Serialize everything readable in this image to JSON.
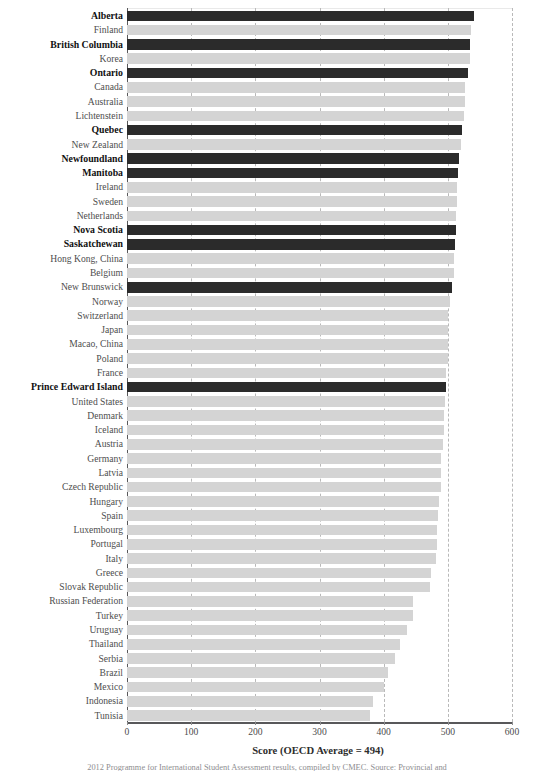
{
  "chart_data": {
    "type": "bar",
    "orientation": "horizontal",
    "title": "",
    "subtitle": "",
    "xlabel": "Score (OECD Average = 494)",
    "ylabel": "",
    "xlim": [
      0,
      600
    ],
    "xticks": [
      0,
      100,
      200,
      300,
      400,
      500,
      600
    ],
    "xtick_labels": [
      "0",
      "100",
      "200",
      "300",
      "400",
      "500",
      "600"
    ],
    "grid": "vertical-dashed",
    "legend": "none",
    "oecd_average": 494,
    "colors": {
      "highlight": "#2b2b2b",
      "default": "#d4d4d4",
      "grid": "#b9b9b9",
      "axis": "#58585a"
    },
    "categories": [
      "Alberta",
      "Finland",
      "British Columbia",
      "Korea",
      "Ontario",
      "Canada",
      "Australia",
      "Lichtenstein",
      "Quebec",
      "New Zealand",
      "Newfoundland",
      "Manitoba",
      "Ireland",
      "Sweden",
      "Netherlands",
      "Nova Scotia",
      "Saskatchewan",
      "Hong Kong, China",
      "Belgium",
      "New Brunswick",
      "Norway",
      "Switzerland",
      "Japan",
      "Macao, China",
      "Poland",
      "France",
      "Prince Edward Island",
      "United States",
      "Denmark",
      "Iceland",
      "Austria",
      "Germany",
      "Latvia",
      "Czech Republic",
      "Hungary",
      "Spain",
      "Luxembourg",
      "Portugal",
      "Italy",
      "Greece",
      "Slovak Republic",
      "Russian Federation",
      "Turkey",
      "Uruguay",
      "Thailand",
      "Serbia",
      "Brazil",
      "Mexico",
      "Indonesia",
      "Tunisia"
    ],
    "values": [
      541,
      536,
      535,
      534,
      531,
      527,
      527,
      525,
      522,
      521,
      517,
      516,
      515,
      515,
      513,
      512,
      511,
      510,
      509,
      506,
      503,
      501,
      500,
      500,
      500,
      497,
      497,
      495,
      494,
      494,
      492,
      490,
      490,
      489,
      486,
      484,
      483,
      483,
      481,
      473,
      472,
      446,
      445,
      436,
      425,
      417,
      406,
      401,
      383,
      379
    ],
    "highlighted": [
      "Alberta",
      "British Columbia",
      "Ontario",
      "Quebec",
      "Newfoundland",
      "Manitoba",
      "Nova Scotia",
      "Saskatchewan",
      "New Brunswick",
      "Prince Edward Island"
    ],
    "bold_labels": [
      "Alberta",
      "British Columbia",
      "Ontario",
      "Quebec",
      "Newfoundland",
      "Manitoba",
      "Nova Scotia",
      "Saskatchewan",
      "Prince Edward Island"
    ],
    "rows": [
      {
        "label": "Alberta",
        "value": 541,
        "highlight": true,
        "bold": true
      },
      {
        "label": "Finland",
        "value": 536,
        "highlight": false,
        "bold": false
      },
      {
        "label": "British Columbia",
        "value": 535,
        "highlight": true,
        "bold": true
      },
      {
        "label": "Korea",
        "value": 534,
        "highlight": false,
        "bold": false
      },
      {
        "label": "Ontario",
        "value": 531,
        "highlight": true,
        "bold": true
      },
      {
        "label": "Canada",
        "value": 527,
        "highlight": false,
        "bold": false
      },
      {
        "label": "Australia",
        "value": 527,
        "highlight": false,
        "bold": false
      },
      {
        "label": "Lichtenstein",
        "value": 525,
        "highlight": false,
        "bold": false
      },
      {
        "label": "Quebec",
        "value": 522,
        "highlight": true,
        "bold": true
      },
      {
        "label": "New Zealand",
        "value": 521,
        "highlight": false,
        "bold": false
      },
      {
        "label": "Newfoundland",
        "value": 517,
        "highlight": true,
        "bold": true
      },
      {
        "label": "Manitoba",
        "value": 516,
        "highlight": true,
        "bold": true
      },
      {
        "label": "Ireland",
        "value": 515,
        "highlight": false,
        "bold": false
      },
      {
        "label": "Sweden",
        "value": 515,
        "highlight": false,
        "bold": false
      },
      {
        "label": "Netherlands",
        "value": 513,
        "highlight": false,
        "bold": false
      },
      {
        "label": "Nova Scotia",
        "value": 512,
        "highlight": true,
        "bold": true
      },
      {
        "label": "Saskatchewan",
        "value": 511,
        "highlight": true,
        "bold": true
      },
      {
        "label": "Hong Kong, China",
        "value": 510,
        "highlight": false,
        "bold": false
      },
      {
        "label": "Belgium",
        "value": 509,
        "highlight": false,
        "bold": false
      },
      {
        "label": "New Brunswick",
        "value": 506,
        "highlight": true,
        "bold": false
      },
      {
        "label": "Norway",
        "value": 503,
        "highlight": false,
        "bold": false
      },
      {
        "label": "Switzerland",
        "value": 501,
        "highlight": false,
        "bold": false
      },
      {
        "label": "Japan",
        "value": 500,
        "highlight": false,
        "bold": false
      },
      {
        "label": "Macao, China",
        "value": 500,
        "highlight": false,
        "bold": false
      },
      {
        "label": "Poland",
        "value": 500,
        "highlight": false,
        "bold": false
      },
      {
        "label": "France",
        "value": 497,
        "highlight": false,
        "bold": false
      },
      {
        "label": "Prince Edward Island",
        "value": 497,
        "highlight": true,
        "bold": true
      },
      {
        "label": "United States",
        "value": 495,
        "highlight": false,
        "bold": false
      },
      {
        "label": "Denmark",
        "value": 494,
        "highlight": false,
        "bold": false
      },
      {
        "label": "Iceland",
        "value": 494,
        "highlight": false,
        "bold": false
      },
      {
        "label": "Austria",
        "value": 492,
        "highlight": false,
        "bold": false
      },
      {
        "label": "Germany",
        "value": 490,
        "highlight": false,
        "bold": false
      },
      {
        "label": "Latvia",
        "value": 490,
        "highlight": false,
        "bold": false
      },
      {
        "label": "Czech Republic",
        "value": 489,
        "highlight": false,
        "bold": false
      },
      {
        "label": "Hungary",
        "value": 486,
        "highlight": false,
        "bold": false
      },
      {
        "label": "Spain",
        "value": 484,
        "highlight": false,
        "bold": false
      },
      {
        "label": "Luxembourg",
        "value": 483,
        "highlight": false,
        "bold": false
      },
      {
        "label": "Portugal",
        "value": 483,
        "highlight": false,
        "bold": false
      },
      {
        "label": "Italy",
        "value": 481,
        "highlight": false,
        "bold": false
      },
      {
        "label": "Greece",
        "value": 473,
        "highlight": false,
        "bold": false
      },
      {
        "label": "Slovak Republic",
        "value": 472,
        "highlight": false,
        "bold": false
      },
      {
        "label": "Russian Federation",
        "value": 446,
        "highlight": false,
        "bold": false
      },
      {
        "label": "Turkey",
        "value": 445,
        "highlight": false,
        "bold": false
      },
      {
        "label": "Uruguay",
        "value": 436,
        "highlight": false,
        "bold": false
      },
      {
        "label": "Thailand",
        "value": 425,
        "highlight": false,
        "bold": false
      },
      {
        "label": "Serbia",
        "value": 417,
        "highlight": false,
        "bold": false
      },
      {
        "label": "Brazil",
        "value": 406,
        "highlight": false,
        "bold": false
      },
      {
        "label": "Mexico",
        "value": 401,
        "highlight": false,
        "bold": false
      },
      {
        "label": "Indonesia",
        "value": 383,
        "highlight": false,
        "bold": false
      },
      {
        "label": "Tunisia",
        "value": 379,
        "highlight": false,
        "bold": false
      }
    ]
  },
  "footer": {
    "note": "2012 Programme for International Student Assessment results, compiled by CMEC. Source: Provincial and"
  }
}
